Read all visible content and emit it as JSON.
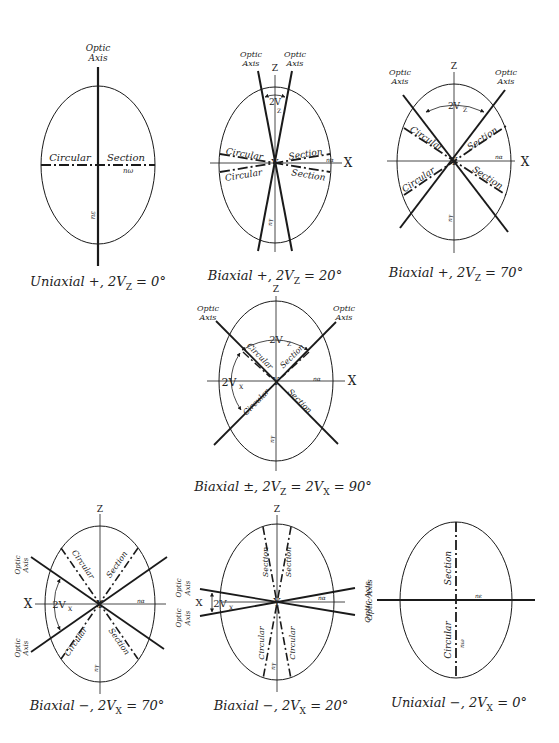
{
  "figure": {
    "colors": {
      "ink": "#1a1a1a",
      "background": "#ffffff"
    }
  },
  "panels": [
    {
      "id": "uniaxial-positive",
      "caption": "Uniaxial +, 2Vz = 0°",
      "caption_main": "Uniaxial +, 2V",
      "caption_sub": "Z",
      "caption_tail": " = 0°",
      "labels": {
        "optic_axis": "Optic Axis",
        "circular": "Circular",
        "section": "Section",
        "n_omega": "nω",
        "n_e": "nε"
      }
    },
    {
      "id": "biaxial-positive-20",
      "caption": "Biaxial +, 2Vz = 20°",
      "caption_main": "Biaxial +, 2V",
      "caption_sub": "Z",
      "caption_tail": " = 20°",
      "labels": {
        "optic_axis_left": "Optic Axis",
        "optic_axis_right": "Optic Axis",
        "z": "Z",
        "x": "X",
        "y": "Y",
        "angle": "2Vz",
        "circular": "Circular",
        "section": "Section",
        "n_alpha": "nα",
        "n_gamma": "nγ"
      }
    },
    {
      "id": "biaxial-positive-70",
      "caption": "Biaxial +, 2Vz = 70°",
      "caption_main": "Biaxial +, 2V",
      "caption_sub": "Z",
      "caption_tail": " = 70°",
      "labels": {
        "optic_axis_left": "Optic Axis",
        "optic_axis_right": "Optic Axis",
        "z": "Z",
        "x": "X",
        "y": "Y",
        "angle": "2Vz",
        "circular": "Circular",
        "section": "Section",
        "n_alpha": "nα",
        "n_gamma": "nγ"
      }
    },
    {
      "id": "biaxial-neutral-90",
      "caption": "Biaxial ±, 2Vz = 2Vx = 90°",
      "caption_main": "Biaxial ±, 2V",
      "caption_sub": "Z",
      "caption_tail": " = 2V",
      "caption_sub2": "X",
      "caption_tail2": " = 90°",
      "labels": {
        "optic_axis_left": "Optic Axis",
        "optic_axis_right": "Optic Axis",
        "z": "Z",
        "x": "X",
        "y": "Y",
        "angle_z": "2Vz",
        "angle_x": "2Vx",
        "circular": "Circular",
        "section": "Section",
        "n_alpha": "nα",
        "n_gamma": "nγ"
      }
    },
    {
      "id": "biaxial-negative-70",
      "caption": "Biaxial −, 2Vx = 70°",
      "caption_main": "Biaxial −, 2V",
      "caption_sub": "X",
      "caption_tail": " = 70°",
      "labels": {
        "optic_axis_upper": "Optic Axis",
        "optic_axis_lower": "Optic Axis",
        "z": "Z",
        "x": "X",
        "y": "Y",
        "angle": "2Vx",
        "circular": "Circular",
        "section": "Section",
        "n_alpha": "nα",
        "n_gamma": "nγ"
      }
    },
    {
      "id": "biaxial-negative-20",
      "caption": "Biaxial −, 2Vx = 20°",
      "caption_main": "Biaxial −, 2V",
      "caption_sub": "X",
      "caption_tail": " = 20°",
      "labels": {
        "optic_axis_upper": "Optic Axis",
        "optic_axis_lower": "Optic Axis",
        "z": "Z",
        "x": "X",
        "y": "Y",
        "angle": "2Vx",
        "circular": "Circular",
        "section": "Section",
        "n_alpha": "nα",
        "n_gamma": "nγ"
      }
    },
    {
      "id": "uniaxial-negative",
      "caption": "Uniaxial −, 2Vx = 0°",
      "caption_main": "Uniaxial −, 2V",
      "caption_sub": "X",
      "caption_tail": " = 0°",
      "labels": {
        "optic_axis": "Optic Axis",
        "circular": "Circular",
        "section": "Section",
        "n_omega": "nω",
        "n_e": "nε"
      }
    }
  ]
}
